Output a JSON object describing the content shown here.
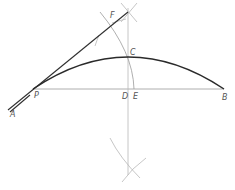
{
  "diagram": {
    "title": "",
    "labels": {
      "A": "A",
      "P": "P",
      "D": "D",
      "E": "E",
      "B": "B",
      "C": "C",
      "F": "F"
    },
    "points": {
      "A": [
        10,
        111
      ],
      "P": [
        33,
        89
      ],
      "D": [
        128,
        89
      ],
      "E": [
        134,
        89
      ],
      "B": [
        224,
        89
      ],
      "C": [
        128,
        57
      ],
      "F": [
        112,
        17
      ],
      "top_intersection": [
        128,
        12
      ],
      "bottom_intersection": [
        128,
        168
      ]
    },
    "colors": {
      "background": "#ffffff",
      "construction": "#b8b8b8",
      "main_curve": "#2a2a2a",
      "label": "#555555"
    }
  }
}
